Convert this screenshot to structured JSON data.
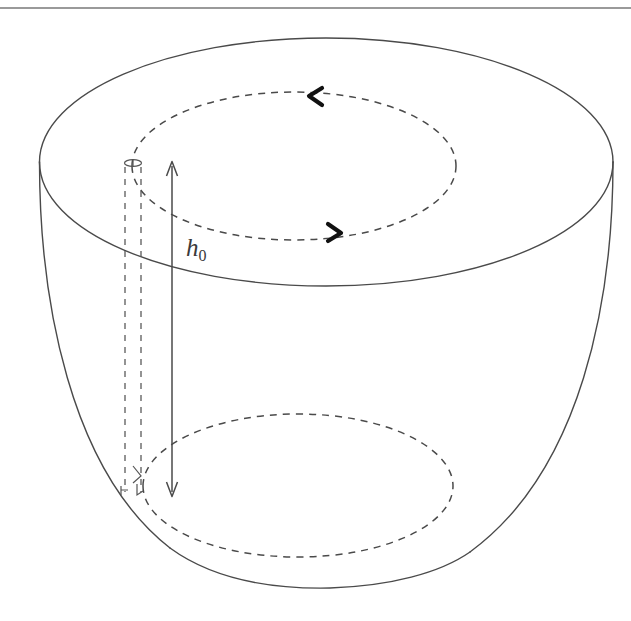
{
  "figure": {
    "kind": "3d-paraboloid-bowl-diagram",
    "caption_label": "h",
    "caption_subscript": "0",
    "top_rule_color": "#9a9a9a",
    "line_color": "#4a4a4a",
    "dash_color": "#4a4a4a",
    "arrow_color": "#111111",
    "background": "#ffffff",
    "annotations": {
      "height_label": "h₀",
      "height_label_base": "h",
      "height_label_sub": "0"
    },
    "geometry": {
      "canvas_width": 631,
      "canvas_height": 621,
      "top_rim_ellipse": {
        "cx": 326,
        "cy": 162,
        "rx": 287,
        "ry": 124
      },
      "inner_dashed_ellipse_top": {
        "cx": 294,
        "cy": 165,
        "rx": 162,
        "ry": 73
      },
      "inner_dashed_ellipse_bottom": {
        "cx": 298,
        "cy": 485,
        "rx": 155,
        "ry": 71
      },
      "bowl_bottom_y": 588,
      "height_arrow_x": 172,
      "height_arrow_top_y": 162,
      "height_arrow_bottom_y": 496,
      "dashed_vertical_left_x": 125,
      "dashed_vertical_right_x": 141,
      "top_rule_y": 8
    },
    "arrow_markers": [
      {
        "name": "top-flow-chevron",
        "direction": "left",
        "x": 314,
        "y": 96
      },
      {
        "name": "bottom-flow-chevron",
        "direction": "right",
        "x": 335,
        "y": 232
      }
    ]
  }
}
